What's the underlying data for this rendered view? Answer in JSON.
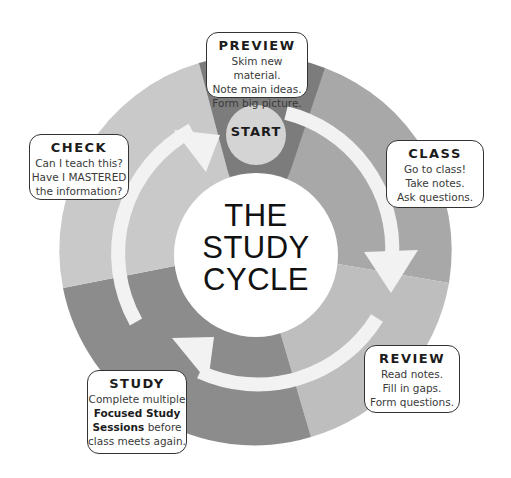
{
  "diagram": {
    "title_lines": [
      "THE",
      "STUDY",
      "CYCLE"
    ],
    "start_label": "START",
    "colors": {
      "preview_segment": "#7c7c7c",
      "class_segment": "#a8a8a8",
      "review_segment": "#bebebe",
      "study_segment": "#8c8c8c",
      "check_segment": "#c9c9c9",
      "start_circle": "#d4d4d4",
      "arrow": "#f2f2f2"
    },
    "stages": [
      {
        "id": "preview",
        "title": "PREVIEW",
        "lines": [
          "Skim new material.",
          "Note main ideas.",
          "Form big picture."
        ]
      },
      {
        "id": "class",
        "title": "CLASS",
        "lines": [
          "Go to class!",
          "Take notes.",
          "Ask questions."
        ]
      },
      {
        "id": "review",
        "title": "REVIEW",
        "lines": [
          "Read notes.",
          "Fill in gaps.",
          "Form questions."
        ]
      },
      {
        "id": "study",
        "title": "STUDY",
        "lines_pre": "Complete multiple",
        "bold": "Focused Study Sessions",
        "bold_line1": "Focused Study",
        "bold_line2": "Sessions",
        "after_bold": " before",
        "last_line": "class meets again."
      },
      {
        "id": "check",
        "title": "CHECK",
        "lines": [
          "Can I teach this?",
          "Have I MASTERED",
          "the information?"
        ]
      }
    ]
  }
}
